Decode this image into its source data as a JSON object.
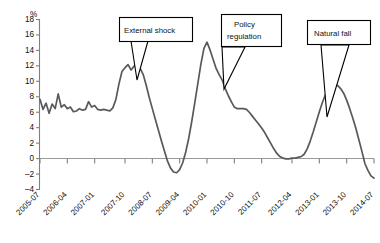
{
  "chart_data": {
    "type": "line",
    "title": "",
    "xlabel": "",
    "ylabel": "%",
    "ylim": [
      -4,
      18
    ],
    "yticks": [
      -4,
      -2,
      0,
      2,
      4,
      6,
      8,
      10,
      12,
      14,
      16,
      18
    ],
    "grid": false,
    "legend": "none",
    "zero_line": true,
    "xtick_labels": [
      "2005-07",
      "2006-04",
      "2007-01",
      "2007-10",
      "2008-07",
      "2009-04",
      "2010-01",
      "2010-10",
      "2011-07",
      "2012-04",
      "2013-01",
      "2013-10",
      "2014-07"
    ],
    "x": [
      "2005-07",
      "2005-08",
      "2005-09",
      "2005-10",
      "2005-11",
      "2005-12",
      "2006-01",
      "2006-02",
      "2006-03",
      "2006-04",
      "2006-05",
      "2006-06",
      "2006-07",
      "2006-08",
      "2006-09",
      "2006-10",
      "2006-11",
      "2006-12",
      "2007-01",
      "2007-02",
      "2007-03",
      "2007-04",
      "2007-05",
      "2007-06",
      "2007-07",
      "2007-08",
      "2007-09",
      "2007-10",
      "2007-11",
      "2007-12",
      "2008-01",
      "2008-02",
      "2008-03",
      "2008-04",
      "2008-05",
      "2008-06",
      "2008-07",
      "2008-08",
      "2008-09",
      "2008-10",
      "2008-11",
      "2008-12",
      "2009-01",
      "2009-02",
      "2009-03",
      "2009-04",
      "2009-05",
      "2009-06",
      "2009-07",
      "2009-08",
      "2009-09",
      "2009-10",
      "2009-11",
      "2009-12",
      "2010-01",
      "2010-02",
      "2010-03",
      "2010-04",
      "2010-05",
      "2010-06",
      "2010-07",
      "2010-08",
      "2010-09",
      "2010-10",
      "2010-11",
      "2010-12",
      "2011-01",
      "2011-02",
      "2011-03",
      "2011-04",
      "2011-05",
      "2011-06",
      "2011-07",
      "2011-08",
      "2011-09",
      "2011-10",
      "2011-11",
      "2011-12",
      "2012-01",
      "2012-02",
      "2012-03",
      "2012-04",
      "2012-05",
      "2012-06",
      "2012-07",
      "2012-08",
      "2012-09",
      "2012-10",
      "2012-11",
      "2012-12",
      "2013-01",
      "2013-02",
      "2013-03",
      "2013-04",
      "2013-05",
      "2013-06",
      "2013-07",
      "2013-08",
      "2013-09",
      "2013-10",
      "2013-11",
      "2013-12",
      "2014-01",
      "2014-02",
      "2014-03",
      "2014-04",
      "2014-05",
      "2014-06",
      "2014-07",
      "2014-08",
      "2014-09"
    ],
    "series": [
      {
        "name": "Growth rate",
        "values": [
          7.6,
          6.3,
          7.1,
          5.8,
          7.0,
          6.4,
          8.3,
          6.6,
          6.9,
          6.4,
          6.6,
          6.0,
          6.1,
          6.4,
          6.2,
          6.3,
          7.3,
          6.6,
          6.8,
          6.3,
          6.2,
          6.3,
          6.2,
          6.1,
          6.5,
          7.6,
          9.6,
          11.2,
          11.7,
          12.1,
          11.4,
          11.9,
          12.0,
          11.6,
          10.8,
          9.4,
          7.8,
          6.4,
          5.0,
          3.6,
          2.2,
          0.9,
          -0.4,
          -1.3,
          -1.8,
          -1.9,
          -1.5,
          -0.6,
          0.8,
          2.6,
          4.8,
          7.2,
          9.7,
          12.2,
          14.2,
          15.0,
          14.0,
          12.8,
          11.6,
          10.8,
          10.1,
          9.0,
          8.1,
          7.3,
          6.6,
          6.4,
          6.4,
          6.4,
          6.3,
          5.9,
          5.4,
          4.9,
          4.4,
          3.9,
          3.3,
          2.6,
          1.9,
          1.2,
          0.6,
          0.2,
          0.0,
          -0.1,
          -0.1,
          0.0,
          0.0,
          0.1,
          0.2,
          0.5,
          1.2,
          2.2,
          3.4,
          4.7,
          6.0,
          7.2,
          8.2,
          8.9,
          9.4,
          9.5,
          9.4,
          9.0,
          8.4,
          7.5,
          6.4,
          5.2,
          3.9,
          2.4,
          0.9,
          -0.7,
          -1.6,
          -2.3,
          -2.6
        ]
      }
    ],
    "annotations": [
      {
        "label": "External shock",
        "lines": [
          "External shock"
        ]
      },
      {
        "label": "Policy regulation",
        "lines": [
          "Policy",
          "regulation"
        ]
      },
      {
        "label": "Natural fall",
        "lines": [
          "Natural fall"
        ]
      }
    ]
  },
  "axis": {
    "y_unit": "%",
    "y_ticks": [
      "18",
      "16",
      "14",
      "12",
      "10",
      "8",
      "6",
      "4",
      "2",
      "0",
      "-2",
      "-4"
    ],
    "x_ticks": [
      "2005-07",
      "2006-04",
      "2007-01",
      "2007-10",
      "2008-07",
      "2009-04",
      "2010-01",
      "2010-10",
      "2011-07",
      "2012-04",
      "2013-01",
      "2013-10",
      "2014-07"
    ]
  },
  "callouts": {
    "c1_line1": "External shock",
    "c2_line1": "Policy",
    "c2_line2": "regulation",
    "c3_line1": "Natural fall"
  },
  "colors": {
    "series": "#59595c",
    "axis": "#808080",
    "callout_border": "#000000",
    "background": "#ffffff"
  }
}
